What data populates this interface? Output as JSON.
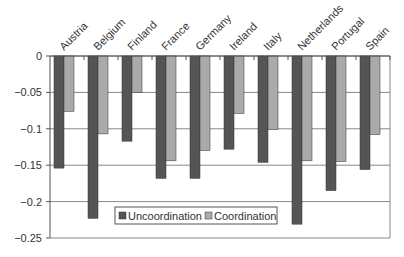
{
  "chart_data": {
    "type": "bar",
    "title": "",
    "xlabel": "",
    "ylabel": "",
    "categories": [
      "Austria",
      "Belgium",
      "Finland",
      "France",
      "Germany",
      "Ireland",
      "Italy",
      "Netherlands",
      "Portugal",
      "Spain"
    ],
    "series": [
      {
        "name": "Uncoordination",
        "color": "#555555",
        "values": [
          -0.154,
          -0.223,
          -0.117,
          -0.168,
          -0.168,
          -0.128,
          -0.146,
          -0.231,
          -0.185,
          -0.156
        ]
      },
      {
        "name": "Coordination",
        "color": "#aaaaaa",
        "values": [
          -0.076,
          -0.107,
          -0.05,
          -0.144,
          -0.13,
          -0.079,
          -0.101,
          -0.144,
          -0.145,
          -0.108
        ]
      }
    ],
    "ylim": [
      -0.25,
      0
    ],
    "yticks": [
      0,
      -0.05,
      -0.1,
      -0.15,
      -0.2,
      -0.25
    ],
    "ytick_labels": [
      "0",
      "-0.05",
      "-0.1",
      "-0.15",
      "-0.2",
      "-0.25"
    ],
    "grid": true,
    "legend_position": "lower center inside",
    "category_axis_position": "top",
    "category_label_rotation": -45
  }
}
